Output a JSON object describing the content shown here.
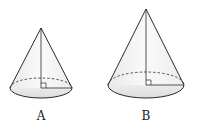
{
  "figure": {
    "cones": [
      {
        "label": "A",
        "apex": [
          41,
          28
        ],
        "base_center": [
          41,
          88
        ],
        "rx": 31,
        "ry": 10,
        "label_pos": [
          41,
          118
        ]
      },
      {
        "label": "B",
        "apex": [
          146,
          9
        ],
        "base_center": [
          146,
          85
        ],
        "rx": 38,
        "ry": 13,
        "label_pos": [
          146,
          118
        ]
      }
    ],
    "colors": {
      "stroke": "#2a2a2a",
      "fill_side": "#f3f3f3",
      "fill_base": "#e4e4e4"
    }
  }
}
